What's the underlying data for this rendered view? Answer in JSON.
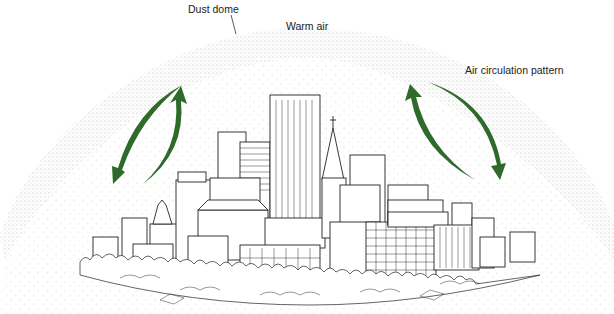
{
  "diagram": {
    "type": "illustration",
    "labels": {
      "dust_dome": "Dust dome",
      "warm_air": "Warm air",
      "air_circulation": "Air circulation pattern"
    },
    "colors": {
      "arrow": "#2e6b2a",
      "dome_stipple": "#555555",
      "line_art": "#222222",
      "background": "#ffffff"
    },
    "elements": [
      {
        "name": "dust-dome",
        "shape": "stippled arc"
      },
      {
        "name": "left-circulation-arrows",
        "count": 2,
        "direction": "down-left and up"
      },
      {
        "name": "right-circulation-arrows",
        "count": 2,
        "direction": "up and down-right"
      },
      {
        "name": "city-skyline",
        "style": "line drawing with trees at base"
      }
    ]
  }
}
